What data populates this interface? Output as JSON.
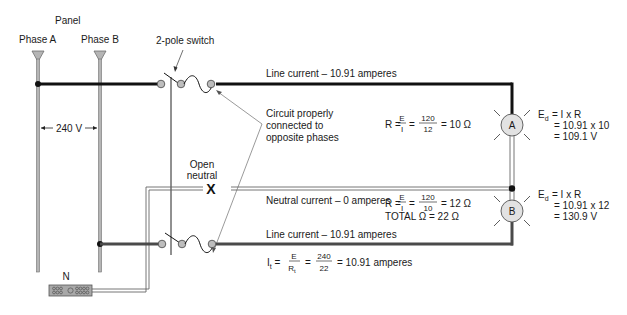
{
  "panel": {
    "title": "Panel",
    "phase_a_label": "Phase A",
    "phase_b_label": "Phase B",
    "voltage_label": "240 V",
    "neutral_bar_label": "N"
  },
  "switch": {
    "label": "2-pole switch"
  },
  "annotation": {
    "line1": "Circuit properly",
    "line2": "connected to",
    "line3": "opposite phases"
  },
  "open_neutral": {
    "line1": "Open",
    "line2": "neutral",
    "marker": "X"
  },
  "currents": {
    "top_line": "Line current – 10.91 amperes",
    "neutral": "Neutral current – 0 amperes",
    "bottom_line": "Line current – 10.91 amperes"
  },
  "lamp_a": {
    "label": "A",
    "r_prefix": "R =",
    "r_num_sym": "E",
    "r_den_sym": "I",
    "r_num_val": "120",
    "r_den_val": "12",
    "r_result": "= 10 Ω",
    "ed_line1": "= I x R",
    "ed_line2": "= 10.91 x 10",
    "ed_line3": "= 109.1 V"
  },
  "lamp_b": {
    "label": "B",
    "r_prefix": "R =",
    "r_num_sym": "E",
    "r_den_sym": "I",
    "r_num_val": "120",
    "r_den_val": "10",
    "r_result": "= 12 Ω",
    "total": "TOTAL Ω  =  22 Ω",
    "ed_line1": "= I x R",
    "ed_line2": "= 10.91 x 12",
    "ed_line3": "= 130.9 V"
  },
  "total_current": {
    "num": "E",
    "den_val": "240",
    "den_val2": "22",
    "result": "= 10.91 amperes"
  },
  "colors": {
    "bus_fill": "#b5b5b5",
    "bus_stroke": "#6e6e6e",
    "wire_top": "#111111",
    "wire_bottom": "#4a4a4a",
    "terminal_fill": "#bdbdbd",
    "lamp_fill": "#e2e2e2"
  }
}
